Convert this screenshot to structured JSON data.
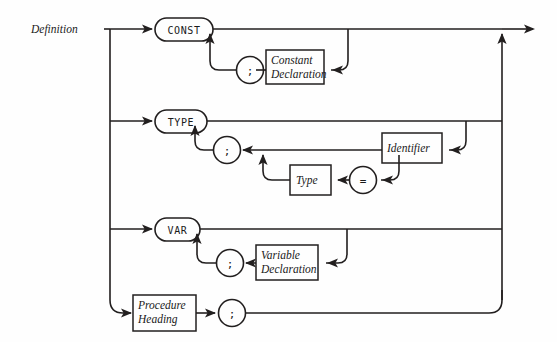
{
  "diagram": {
    "type": "railroad-syntax-diagram",
    "title": "Definition",
    "entry_label": "Definition",
    "background_color": "#fefefe",
    "line_color": "#221f1f",
    "branches": [
      {
        "id": "const-branch",
        "keyword": "CONST",
        "keyword_kind": "terminal",
        "loop_separator": ";",
        "items": [
          {
            "kind": "nonterminal",
            "label_line1": "Constant",
            "label_line2": "Declaration"
          }
        ]
      },
      {
        "id": "type-branch",
        "keyword": "TYPE",
        "keyword_kind": "terminal",
        "loop_separator": ";",
        "items": [
          {
            "kind": "nonterminal",
            "label_line1": "Identifier",
            "label_line2": ""
          },
          {
            "kind": "terminal",
            "label_line1": "=",
            "label_line2": ""
          },
          {
            "kind": "nonterminal",
            "label_line1": "Type",
            "label_line2": ""
          }
        ]
      },
      {
        "id": "var-branch",
        "keyword": "VAR",
        "keyword_kind": "terminal",
        "loop_separator": ";",
        "items": [
          {
            "kind": "nonterminal",
            "label_line1": "Variable",
            "label_line2": "Declaration"
          }
        ]
      },
      {
        "id": "procedure-branch",
        "keyword": "",
        "keyword_kind": "none",
        "loop_separator": "",
        "items": [
          {
            "kind": "nonterminal",
            "label_line1": "Procedure",
            "label_line2": "Heading"
          },
          {
            "kind": "terminal",
            "label_line1": ";",
            "label_line2": ""
          }
        ]
      }
    ],
    "nodes": {
      "const_keyword": "CONST",
      "type_keyword": "TYPE",
      "var_keyword": "VAR",
      "semicolon_const": ";",
      "semicolon_type": ";",
      "semicolon_var": ";",
      "semicolon_proc": ";",
      "equals_sign": "=",
      "constant_declaration_l1": "Constant",
      "constant_declaration_l2": "Declaration",
      "identifier": "Identifier",
      "type_box": "Type",
      "variable_declaration_l1": "Variable",
      "variable_declaration_l2": "Declaration",
      "procedure_heading_l1": "Procedure",
      "procedure_heading_l2": "Heading"
    }
  }
}
